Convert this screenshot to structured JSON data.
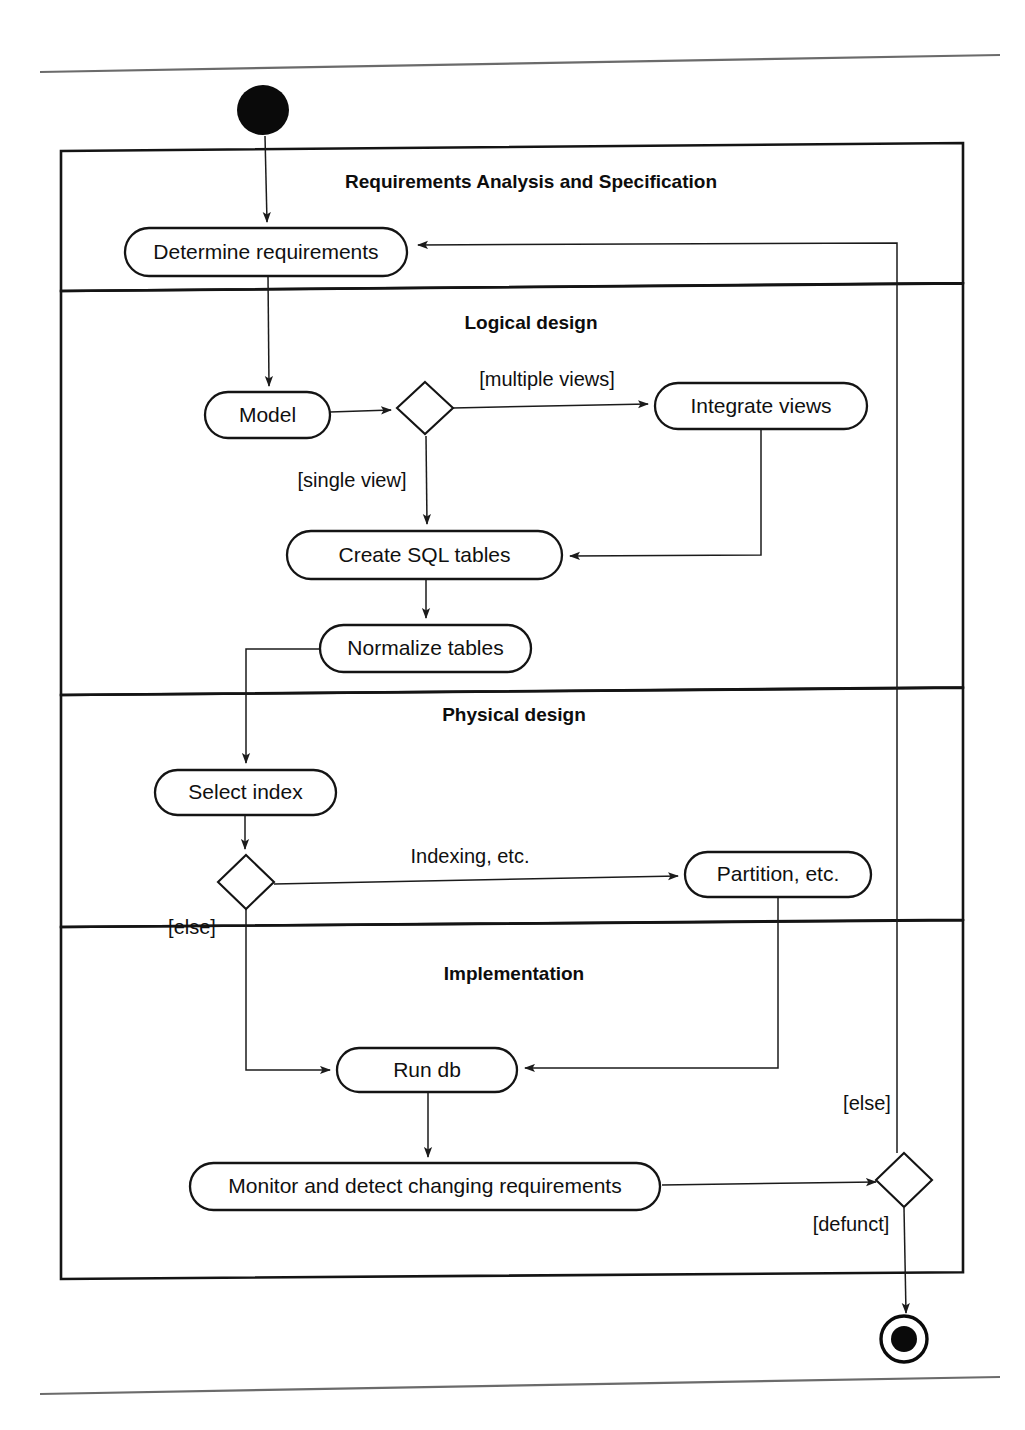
{
  "diagram": {
    "type": "uml-activity-diagram",
    "canvas": {
      "width": 1025,
      "height": 1430
    },
    "page_rules": [
      {
        "name": "top-rule",
        "x1": 40,
        "y1": 72,
        "x2": 1000,
        "y2": 55
      },
      {
        "name": "bottom-rule",
        "x1": 40,
        "y1": 1394,
        "x2": 1000,
        "y2": 1377
      }
    ],
    "swimlanes": [
      {
        "id": "requirements",
        "label": "Requirements Analysis and Specification",
        "label_x": 531,
        "label_y": 183,
        "box": {
          "x": 61,
          "y": 151,
          "width": 902,
          "height": 140
        }
      },
      {
        "id": "logical",
        "label": "Logical design",
        "label_x": 531,
        "label_y": 324,
        "box": {
          "x": 61,
          "y": 291,
          "width": 902,
          "height": 404
        }
      },
      {
        "id": "physical",
        "label": "Physical design",
        "label_x": 514,
        "label_y": 716,
        "box": {
          "x": 61,
          "y": 695,
          "width": 902,
          "height": 232
        }
      },
      {
        "id": "implementation",
        "label": "Implementation",
        "label_x": 514,
        "label_y": 975,
        "box": {
          "x": 61,
          "y": 927,
          "width": 902,
          "height": 352
        }
      }
    ],
    "nodes": [
      {
        "id": "initial",
        "kind": "initial-node",
        "label": "",
        "cx": 263,
        "cy": 110,
        "rx": 26,
        "ry": 25,
        "lane": "requirements"
      },
      {
        "id": "determine-requirements",
        "kind": "action",
        "label": "Determine  requirements",
        "x": 125,
        "y": 228,
        "width": 282,
        "height": 48,
        "lane": "requirements"
      },
      {
        "id": "model",
        "kind": "action",
        "label": "Model",
        "x": 205,
        "y": 392,
        "width": 125,
        "height": 46,
        "lane": "logical"
      },
      {
        "id": "views-decision",
        "kind": "decision",
        "label": "",
        "cx": 425,
        "cy": 408,
        "rx": 28,
        "ry": 26,
        "lane": "logical"
      },
      {
        "id": "integrate-views",
        "kind": "action",
        "label": "Integrate  views",
        "x": 655,
        "y": 383,
        "width": 212,
        "height": 46,
        "lane": "logical"
      },
      {
        "id": "create-sql-tables",
        "kind": "action",
        "label": "Create SQL tables",
        "x": 287,
        "y": 531,
        "width": 275,
        "height": 48,
        "lane": "logical"
      },
      {
        "id": "normalize-tables",
        "kind": "action",
        "label": "Normalize tables",
        "x": 320,
        "y": 625,
        "width": 211,
        "height": 47,
        "lane": "logical"
      },
      {
        "id": "select-index",
        "kind": "action",
        "label": "Select index",
        "x": 155,
        "y": 770,
        "width": 181,
        "height": 45,
        "lane": "physical"
      },
      {
        "id": "index-decision",
        "kind": "decision",
        "label": "",
        "cx": 246,
        "cy": 882,
        "rx": 28,
        "ry": 27,
        "lane": "physical"
      },
      {
        "id": "partition-etc",
        "kind": "action",
        "label": "Partition, etc.",
        "x": 685,
        "y": 852,
        "width": 186,
        "height": 45,
        "lane": "physical"
      },
      {
        "id": "run-db",
        "kind": "action",
        "label": "Run db",
        "x": 337,
        "y": 1048,
        "width": 180,
        "height": 44,
        "lane": "implementation"
      },
      {
        "id": "monitor-requirements",
        "kind": "action",
        "label": "Monitor and detect changing requirements",
        "x": 190,
        "y": 1163,
        "width": 470,
        "height": 47,
        "lane": "implementation"
      },
      {
        "id": "defunct-decision",
        "kind": "decision",
        "label": "",
        "cx": 904,
        "cy": 1180,
        "rx": 28,
        "ry": 27,
        "lane": "implementation"
      },
      {
        "id": "final",
        "kind": "final-node",
        "label": "",
        "cx": 904,
        "cy": 1339,
        "r_outer": 23,
        "r_inner": 13,
        "lane": "outside"
      }
    ],
    "edges": [
      {
        "id": "e-initial-determine",
        "from": "initial",
        "to": "determine-requirements",
        "guard": "",
        "path": "M 265,136 L 267,222",
        "arrow": true
      },
      {
        "id": "e-determine-model",
        "from": "determine-requirements",
        "to": "model",
        "guard": "",
        "path": "M 268,276 L 269,386",
        "arrow": true
      },
      {
        "id": "e-model-decision",
        "from": "model",
        "to": "views-decision",
        "guard": "",
        "path": "M 330,412 L 391,410",
        "arrow": true
      },
      {
        "id": "e-decision-integrate",
        "from": "views-decision",
        "to": "integrate-views",
        "guard": "[multiple views]",
        "guard_x": 547,
        "guard_y": 381,
        "path": "M 453,408 L 648,404",
        "arrow": true
      },
      {
        "id": "e-decision-createsql",
        "from": "views-decision",
        "to": "create-sql-tables",
        "guard": "[single view]",
        "guard_x": 352,
        "guard_y": 482,
        "path": "M 426,436 L 427,524",
        "arrow": true
      },
      {
        "id": "e-integrate-createsql",
        "from": "integrate-views",
        "to": "create-sql-tables",
        "guard": "",
        "path": "M 761,430 L 761,555 L 570,556",
        "arrow": true
      },
      {
        "id": "e-createsql-normalize",
        "from": "create-sql-tables",
        "to": "normalize-tables",
        "guard": "",
        "path": "M 426,579 L 426,618",
        "arrow": true
      },
      {
        "id": "e-normalize-selectindex",
        "from": "normalize-tables",
        "to": "select-index",
        "guard": "",
        "path": "M 321,649 L 246,649 L 246,763",
        "arrow": true
      },
      {
        "id": "e-selectindex-decision",
        "from": "select-index",
        "to": "index-decision",
        "guard": "",
        "path": "M 245,815 L 245,849",
        "arrow": true
      },
      {
        "id": "e-indexdecision-partition",
        "from": "index-decision",
        "to": "partition-etc",
        "guard": "Indexing, etc.",
        "guard_x": 470,
        "guard_y": 858,
        "path": "M 274,884 L 678,876",
        "arrow": true
      },
      {
        "id": "e-indexdecision-rundb",
        "from": "index-decision",
        "to": "run-db",
        "guard": "[else]",
        "guard_x": 192,
        "guard_y": 929,
        "path": "M 246,909 L 246,1070 L 330,1070",
        "arrow": true
      },
      {
        "id": "e-partition-rundb",
        "from": "partition-etc",
        "to": "run-db",
        "guard": "",
        "path": "M 778,898 L 778,1068 L 525,1068",
        "arrow": true
      },
      {
        "id": "e-rundb-monitor",
        "from": "run-db",
        "to": "monitor-requirements",
        "guard": "",
        "path": "M 428,1092 L 428,1157",
        "arrow": true
      },
      {
        "id": "e-monitor-defunct",
        "from": "monitor-requirements",
        "to": "defunct-decision",
        "guard": "",
        "path": "M 662,1185 L 876,1182",
        "arrow": true
      },
      {
        "id": "e-defunct-final",
        "from": "defunct-decision",
        "to": "final",
        "guard": "[defunct]",
        "guard_x": 851,
        "guard_y": 1226,
        "path": "M 904,1208 L 906,1313",
        "arrow": true
      },
      {
        "id": "e-defunct-determine",
        "from": "defunct-decision",
        "to": "determine-requirements",
        "guard": "[else]",
        "guard_x": 867,
        "guard_y": 1105,
        "path": "M 897,1153 L 897,243 L 418,245",
        "arrow": true
      }
    ],
    "guards": [
      {
        "id": "guard-multiple-views",
        "text": "[multiple views]"
      },
      {
        "id": "guard-single-view",
        "text": "[single view]"
      },
      {
        "id": "guard-indexing",
        "text": "Indexing, etc."
      },
      {
        "id": "guard-else-index",
        "text": "[else]"
      },
      {
        "id": "guard-else-defunct",
        "text": "[else]"
      },
      {
        "id": "guard-defunct",
        "text": "[defunct]"
      }
    ],
    "colors": {
      "ink": "#141414",
      "background": "#ffffff",
      "rule": "#6b6b6b",
      "flow": "#1b1b1b"
    }
  }
}
